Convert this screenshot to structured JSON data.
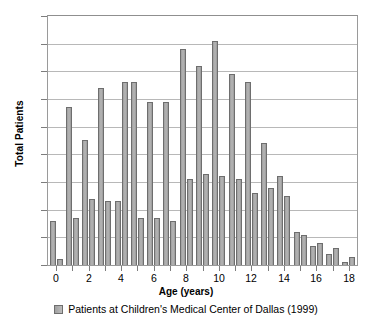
{
  "chart_data": {
    "type": "bar",
    "title": "",
    "xlabel": "Age (years)",
    "ylabel": "Total Patients",
    "ylim": [
      0,
      90
    ],
    "ytick_step": 10,
    "yticks": [
      "90",
      "80",
      "70",
      "60",
      "50",
      "40",
      "30",
      "20",
      "10",
      "0"
    ],
    "xlim": [
      -0.5,
      18.5
    ],
    "categories": [
      "0",
      "1",
      "2",
      "3",
      "4",
      "5",
      "6",
      "7",
      "8",
      "9",
      "10",
      "11",
      "12",
      "13",
      "14",
      "15",
      "16",
      "17",
      "18"
    ],
    "xticks_labeled": [
      "0",
      "2",
      "4",
      "6",
      "8",
      "10",
      "12",
      "14",
      "16",
      "18"
    ],
    "grid": "horizontal",
    "legend_position": "bottom",
    "legend": [
      "Patients at Children's Medical Center of Dallas (1999)"
    ],
    "series": [
      {
        "name": "bar-a",
        "values": [
          16,
          57,
          45,
          64,
          23,
          66,
          59,
          59,
          78,
          72,
          81,
          69,
          66,
          44,
          32,
          12,
          7,
          4,
          1
        ]
      },
      {
        "name": "bar-b",
        "values": [
          2,
          17,
          24,
          23,
          66,
          17,
          17,
          16,
          31,
          33,
          32,
          31,
          26,
          28,
          25,
          11,
          8,
          6,
          3
        ]
      }
    ],
    "colors": {
      "bar_fill": "#b0b0b0",
      "bar_border": "#6e6e6e",
      "gridline": "#b8b8b8",
      "axis": "#9a9a9a",
      "text": "#000000"
    }
  }
}
